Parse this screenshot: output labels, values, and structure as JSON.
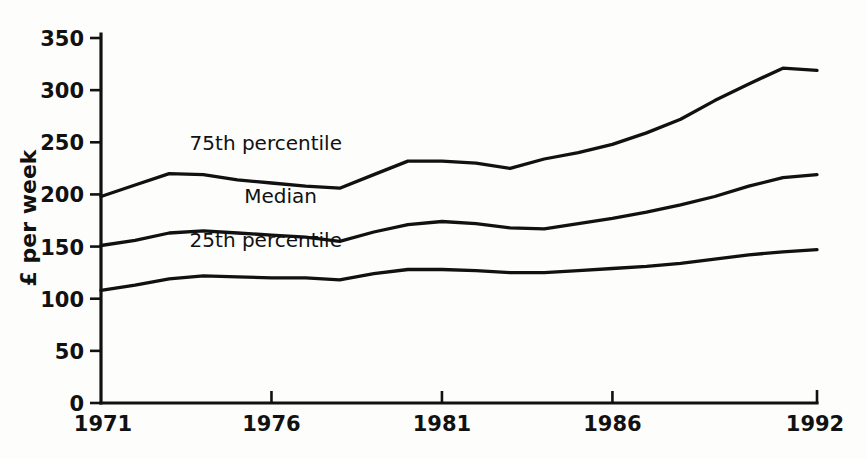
{
  "chart_data": {
    "type": "line",
    "title": "",
    "subtitle": "",
    "xlabel": "",
    "ylabel": "£ per week",
    "xlim": [
      1971,
      1992
    ],
    "ylim": [
      0,
      350
    ],
    "grid": false,
    "legend_position": "inline-labels",
    "y_ticks": [
      0,
      50,
      100,
      150,
      200,
      250,
      300,
      350
    ],
    "y_tick_labels": [
      "0",
      "50",
      "100",
      "150",
      "200",
      "250",
      "300",
      "350"
    ],
    "x_ticks": [
      1971,
      1976,
      1981,
      1986,
      1992
    ],
    "x_tick_labels": [
      "1971",
      "1976",
      "1981",
      "1986",
      "1992"
    ],
    "x": [
      1971,
      1972,
      1973,
      1974,
      1975,
      1976,
      1977,
      1978,
      1979,
      1980,
      1981,
      1982,
      1983,
      1984,
      1985,
      1986,
      1987,
      1988,
      1989,
      1990,
      1991,
      1992
    ],
    "series": [
      {
        "name": "75th percentile",
        "label": "75th percentile",
        "label_x": 1973.6,
        "label_y": 243,
        "values": [
          198,
          209,
          220,
          219,
          214,
          211,
          208,
          206,
          219,
          232,
          232,
          230,
          225,
          234,
          240,
          248,
          259,
          272,
          290,
          306,
          321,
          319
        ]
      },
      {
        "name": "Median",
        "label": "Median",
        "label_x": 1975.2,
        "label_y": 192,
        "values": [
          151,
          156,
          163,
          165,
          163,
          161,
          159,
          155,
          164,
          171,
          174,
          172,
          168,
          167,
          172,
          177,
          183,
          190,
          198,
          208,
          216,
          219
        ]
      },
      {
        "name": "25th percentile",
        "label": "25th percentile",
        "label_x": 1973.6,
        "label_y": 150,
        "values": [
          108,
          113,
          119,
          122,
          121,
          120,
          120,
          118,
          124,
          128,
          128,
          127,
          125,
          125,
          127,
          129,
          131,
          134,
          138,
          142,
          145,
          147
        ]
      }
    ]
  },
  "colors": {
    "line": "#111111",
    "axis": "#111111",
    "background": "#fdfdfb"
  }
}
